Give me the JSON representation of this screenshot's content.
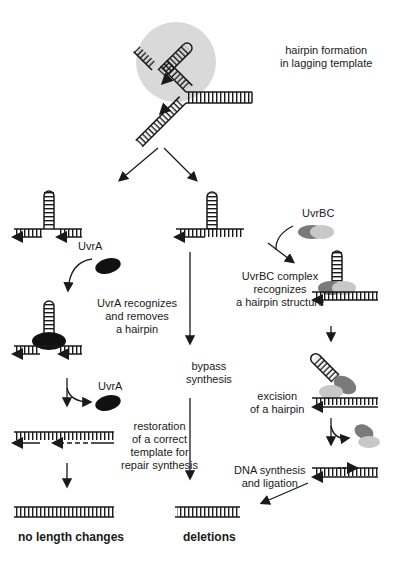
{
  "figure": {
    "type": "pathway-diagram",
    "topic": "Hairpin formation in lagging template and repair/bypass pathways"
  },
  "labels": {
    "hairpin_formation": [
      "hairpin formation",
      "in lagging template"
    ],
    "uvra_1": "UvrA",
    "uvra_recognizes": [
      "UvrA recognizes",
      "and removes",
      "a hairpin"
    ],
    "uvra_2": "UvrA",
    "restoration": [
      "restoration",
      "of a correct",
      "template for",
      "repair synthesis"
    ],
    "bypass": [
      "bypass",
      "synthesis"
    ],
    "uvrbc": "UvrBC",
    "uvrbc_recognizes": [
      "UvrBC complex",
      "recognizes",
      "a hairpin structure"
    ],
    "excision": [
      "excision",
      "of a hairpin"
    ],
    "dna_synthesis": [
      "DNA synthesis",
      "and ligation"
    ]
  },
  "outcomes": {
    "left": "no length changes",
    "middle": "deletions"
  },
  "colors": {
    "ink": "#1a1a1a",
    "highlight_circle": "#d9d9d9",
    "uvra": "#111111",
    "uvrb": "#7a7a7a",
    "uvrc": "#c8c8c8"
  }
}
